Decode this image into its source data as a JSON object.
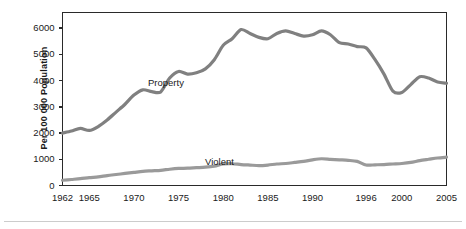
{
  "chart_data": {
    "type": "line",
    "title": "",
    "xlabel": "",
    "ylabel": "Per 100 000 Population",
    "xlim": [
      1962,
      2005
    ],
    "ylim": [
      0,
      6600
    ],
    "grid": false,
    "legend_position": "inline-annotation",
    "y_ticks": [
      0,
      1000,
      2000,
      3000,
      4000,
      5000,
      6000
    ],
    "y_tick_labels": [
      "0",
      "1000",
      "2000",
      "3000",
      "4000",
      "5000",
      "6000"
    ],
    "x_ticks": [
      1962,
      1965,
      1970,
      1975,
      1980,
      1985,
      1990,
      1996,
      2000,
      2005
    ],
    "x_tick_labels": [
      "1962",
      "1965",
      "1970",
      "1975",
      "1980",
      "1985",
      "1990",
      "1996",
      "2000",
      "2005"
    ],
    "x_minor_tick_interval": 1,
    "line_color": "#808080",
    "axis_color": "#2a2a2a",
    "x": [
      1962,
      1963,
      1964,
      1965,
      1966,
      1967,
      1968,
      1969,
      1970,
      1971,
      1972,
      1973,
      1974,
      1975,
      1976,
      1977,
      1978,
      1979,
      1980,
      1981,
      1982,
      1983,
      1984,
      1985,
      1986,
      1987,
      1988,
      1989,
      1990,
      1991,
      1992,
      1993,
      1994,
      1995,
      1996,
      1997,
      1998,
      1999,
      2000,
      2001,
      2002,
      2003,
      2004,
      2005
    ],
    "series": [
      {
        "name": "Property",
        "label": "Property",
        "color": "#808080",
        "values": [
          2000,
          2080,
          2180,
          2100,
          2250,
          2500,
          2800,
          3100,
          3450,
          3650,
          3580,
          3570,
          4100,
          4350,
          4250,
          4300,
          4450,
          4800,
          5350,
          5600,
          5950,
          5800,
          5650,
          5600,
          5800,
          5900,
          5800,
          5700,
          5750,
          5900,
          5750,
          5450,
          5400,
          5300,
          5250,
          4800,
          4250,
          3600,
          3550,
          3850,
          4150,
          4100,
          3950,
          3900
        ]
      },
      {
        "name": "Violent",
        "label": "Violent",
        "color": "#808080",
        "values": [
          200,
          230,
          260,
          300,
          330,
          380,
          420,
          460,
          500,
          540,
          560,
          580,
          620,
          650,
          660,
          680,
          700,
          740,
          820,
          830,
          800,
          780,
          760,
          780,
          820,
          840,
          880,
          920,
          980,
          1020,
          1000,
          980,
          960,
          920,
          780,
          790,
          800,
          820,
          840,
          880,
          950,
          1000,
          1050,
          1080
        ]
      }
    ],
    "annotations": [
      {
        "text": "Property",
        "x_px": 148,
        "y_px": 77
      },
      {
        "text": "Violent",
        "x_px": 205,
        "y_px": 156
      }
    ]
  }
}
